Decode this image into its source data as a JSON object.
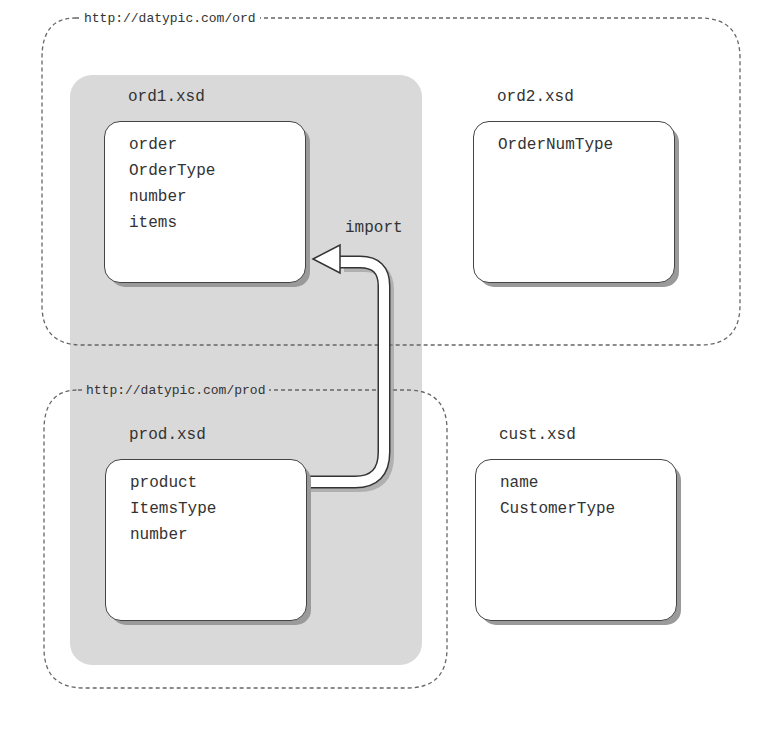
{
  "diagram": {
    "colors": {
      "background": "#ffffff",
      "gray_panel": "#d9d9d9",
      "box_fill": "#ffffff",
      "box_border": "#444444",
      "shadow": "#9a9a9a",
      "text": "#333333",
      "dashed_line": "#666666"
    },
    "namespaces": [
      {
        "id": "ord",
        "label": "http://datypic.com/ord"
      },
      {
        "id": "prod",
        "label": "http://datypic.com/prod"
      }
    ],
    "files": [
      {
        "id": "ord1",
        "title": "ord1.xsd",
        "namespace": "ord",
        "components": [
          "order",
          "OrderType",
          "number",
          "items"
        ]
      },
      {
        "id": "ord2",
        "title": "ord2.xsd",
        "namespace": "ord",
        "components": [
          "OrderNumType"
        ]
      },
      {
        "id": "prod",
        "title": "prod.xsd",
        "namespace": "prod",
        "components": [
          "product",
          "ItemsType",
          "number"
        ]
      },
      {
        "id": "cust",
        "title": "cust.xsd",
        "namespace": "",
        "components": [
          "name",
          "CustomerType"
        ]
      }
    ],
    "arrows": [
      {
        "from": "prod",
        "to": "ord1",
        "label": "import"
      }
    ]
  }
}
